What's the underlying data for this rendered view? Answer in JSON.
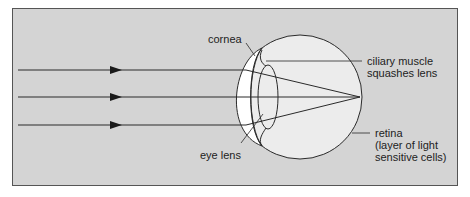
{
  "diagram": {
    "colors": {
      "background": "#d4d4d4",
      "frame": "#555555",
      "eyeball": "#ececec",
      "cornea": "#ffffff",
      "line": "#2a2a2a"
    },
    "rays": [
      {
        "y": 70,
        "label": "light ray 1"
      },
      {
        "y": 97,
        "label": "light ray 2"
      },
      {
        "y": 125,
        "label": "light ray 3"
      }
    ],
    "labels": {
      "cornea": "cornea",
      "ciliary_line1": "ciliary muscle",
      "ciliary_line2": "squashes lens",
      "eye_lens": "eye lens",
      "retina_line1": "retina",
      "retina_line2": "(layer of light",
      "retina_line3": "sensitive cells)"
    }
  }
}
